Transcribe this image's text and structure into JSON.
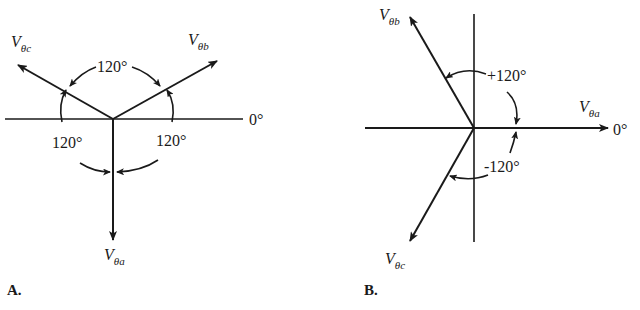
{
  "diagram_a": {
    "panel_label": "A.",
    "axis_label": "0°",
    "vectors": [
      {
        "name": "V",
        "sub": "θa",
        "direction": "down"
      },
      {
        "name": "V",
        "sub": "θb",
        "direction": "upper-right"
      },
      {
        "name": "V",
        "sub": "θc",
        "direction": "upper-left"
      }
    ],
    "angles": {
      "top": "120°",
      "lower_left": "120°",
      "lower_right": "120°"
    }
  },
  "diagram_b": {
    "panel_label": "B.",
    "axis_label": "0°",
    "vectors": [
      {
        "name": "V",
        "sub": "θa",
        "direction": "right (0°)"
      },
      {
        "name": "V",
        "sub": "θb",
        "direction": "+120°"
      },
      {
        "name": "V",
        "sub": "θc",
        "direction": "-120°"
      }
    ],
    "angles": {
      "positive": "+120°",
      "negative": "-120°"
    }
  },
  "colors": {
    "ink": "#1a1a1a",
    "background": "#ffffff"
  }
}
